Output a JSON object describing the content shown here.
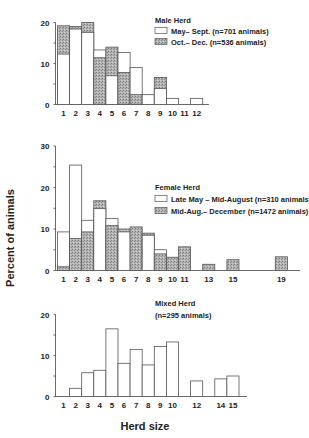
{
  "figure": {
    "ylabel": "Percent of animals",
    "xlabel": "Herd size"
  },
  "colors": {
    "axis": "#444444",
    "bar_outline": "#555555",
    "white_fill": "#ffffff",
    "shaded_fill": "#a8a8a8"
  },
  "chart_data": [
    {
      "type": "bar",
      "title": "Male Herd",
      "xlabel": "",
      "ylabel": "Percent of animals",
      "ylim": [
        0,
        20
      ],
      "yticks": [
        0,
        10,
        20
      ],
      "x_tick_labels": [
        "1",
        "2",
        "3",
        "4",
        "5",
        "6",
        "7",
        "8",
        "9",
        "10",
        "11",
        "12"
      ],
      "legend_position": "upper right",
      "categories": [
        1,
        2,
        3,
        4,
        5,
        6,
        7,
        8,
        9,
        10,
        11,
        12
      ],
      "series": [
        {
          "name": "May– Sept. (n=701 animals)",
          "style": "white",
          "values": [
            12.3,
            18.4,
            17.6,
            13.3,
            7.0,
            12.7,
            9.0,
            2.4,
            3.9,
            1.5,
            0,
            1.5
          ]
        },
        {
          "name": "Oct.– Dec. (n=536 animals)",
          "style": "shaded",
          "values": [
            19.2,
            19.0,
            20.0,
            11.4,
            14.0,
            7.8,
            2.4,
            0,
            6.6,
            0,
            0,
            0
          ]
        }
      ]
    },
    {
      "type": "bar",
      "title": "Female Herd",
      "xlabel": "",
      "ylabel": "Percent of animals",
      "ylim": [
        0,
        30
      ],
      "yticks": [
        0,
        10,
        20,
        30
      ],
      "x_tick_labels": [
        "1",
        "2",
        "3",
        "4",
        "5",
        "6",
        "7",
        "8",
        "9",
        "10",
        "11",
        "13",
        "15",
        "19"
      ],
      "legend_position": "center right",
      "categories": [
        1,
        2,
        3,
        4,
        5,
        6,
        7,
        8,
        9,
        10,
        11,
        12,
        13,
        14,
        15,
        16,
        17,
        18,
        19
      ],
      "series": [
        {
          "name": "Late May – Mid-August (n=310 animals)",
          "style": "white",
          "values": [
            9.3,
            25.4,
            12.1,
            14.9,
            12.5,
            9.3,
            0,
            8.5,
            5.0,
            0,
            0,
            0,
            0,
            0,
            0,
            0,
            0,
            0,
            0
          ]
        },
        {
          "name": "Mid-Aug.– December (n=1472 animals)",
          "style": "shaded",
          "values": [
            0.9,
            7.7,
            9.3,
            16.8,
            10.8,
            10.0,
            10.5,
            9.0,
            4.0,
            3.2,
            5.7,
            0,
            1.5,
            0,
            2.6,
            0,
            0,
            0,
            3.3
          ]
        }
      ]
    },
    {
      "type": "bar",
      "title": "Mixed Herd",
      "subtitle": "(n=295 animals)",
      "xlabel": "Herd size",
      "ylabel": "Percent of animals",
      "ylim": [
        0,
        20
      ],
      "yticks": [
        0,
        10,
        20
      ],
      "x_tick_labels": [
        "1",
        "2",
        "3",
        "4",
        "5",
        "6",
        "7",
        "8",
        "9",
        "10",
        "12",
        "14",
        "15"
      ],
      "legend_position": "upper right",
      "categories": [
        1,
        2,
        3,
        4,
        5,
        6,
        7,
        8,
        9,
        10,
        11,
        12,
        13,
        14,
        15
      ],
      "series": [
        {
          "name": "Mixed Herd (n=295 animals)",
          "style": "white",
          "values": [
            0,
            2.0,
            5.8,
            6.4,
            16.5,
            8.1,
            11.5,
            7.7,
            12.2,
            13.3,
            0,
            3.8,
            0,
            4.3,
            5.0
          ]
        }
      ]
    }
  ]
}
